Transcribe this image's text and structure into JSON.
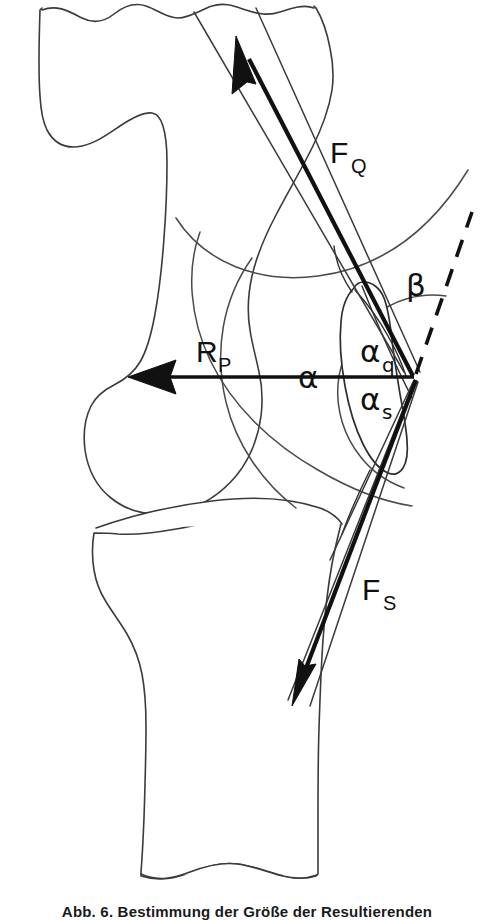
{
  "figure": {
    "background_color": "#ffffff",
    "ink_color": "#111111",
    "outline_color": "#3b3b3b"
  },
  "caption": {
    "text": "Abb. 6. Bestimmung der Größe der Resultierenden"
  },
  "labels": {
    "force_quadriceps": {
      "base": "F",
      "sub": "Q"
    },
    "force_patellar_tendon": {
      "base": "F",
      "sub": "S"
    },
    "resultant_patella": {
      "base": "R",
      "sub": "P"
    },
    "angle_alpha": {
      "base": "α",
      "sub": ""
    },
    "angle_alpha_q": {
      "base": "α",
      "sub": "q"
    },
    "angle_alpha_s": {
      "base": "α",
      "sub": "s"
    },
    "angle_beta": {
      "base": "β",
      "sub": ""
    }
  },
  "anatomy": {
    "femur_label": "femur",
    "tibia_label": "tibia",
    "patella_label": "patella"
  },
  "vectors": {
    "quadriceps_direction": "up-left",
    "patellar_tendon_direction": "down-left",
    "resultant_direction": "left"
  },
  "geometry": {
    "vertex_x": 415,
    "vertex_y": 377,
    "arc_large_radius": 215,
    "arc_small_radius": 86
  }
}
